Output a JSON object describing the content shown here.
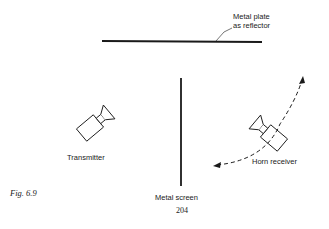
{
  "figure": {
    "caption": "Fig. 6.9",
    "page_number": "204"
  },
  "labels": {
    "reflector_line1": "Metal plate",
    "reflector_line2": "as reflector",
    "transmitter": "Transmitter",
    "receiver": "Horn receiver",
    "screen": "Metal screen"
  },
  "components": [
    {
      "name": "Metal plate as reflector",
      "shape": "horizontal line"
    },
    {
      "name": "Metal screen",
      "shape": "vertical line"
    },
    {
      "name": "Transmitter",
      "shape": "horn antenna icon"
    },
    {
      "name": "Horn receiver",
      "shape": "horn antenna icon, movable along dashed arc"
    }
  ],
  "colors": {
    "ink": "#1a1a1a",
    "background": "#ffffff"
  }
}
